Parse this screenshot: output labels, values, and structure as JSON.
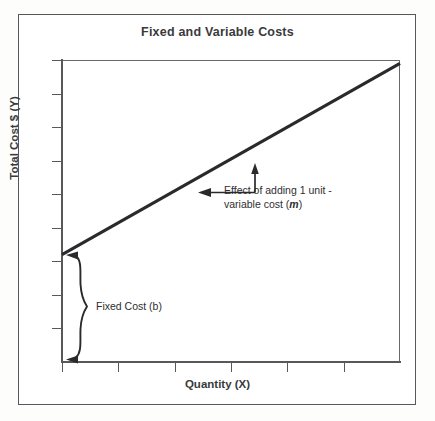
{
  "figure": {
    "title": "Fixed and Variable Costs"
  },
  "chart_data": {
    "type": "line",
    "title": "Fixed and Variable Costs",
    "xlabel": "Quantity (X)",
    "ylabel": "Total Cost $ (Y)",
    "xlim": [
      0,
      6
    ],
    "ylim": [
      0,
      9
    ],
    "grid": false,
    "legend": null,
    "tick_labels": {
      "x": [],
      "y": []
    },
    "x_tick_count": 6,
    "y_tick_count": 9,
    "series": [
      {
        "name": "Total Cost",
        "equation": "Y = mX + b",
        "intercept_b": 3.2,
        "slope_m": 0.95,
        "x": [
          0,
          6
        ],
        "values": [
          3.2,
          8.9
        ]
      }
    ],
    "annotations": [
      {
        "name": "slope-annotation",
        "text_line_1": "Effect of adding 1 unit -",
        "text_line_2": "variable cost (",
        "variable": "m",
        "text_line_2_end": ")",
        "marker": "right-triangle-with-arrows"
      },
      {
        "name": "fixed-cost-annotation",
        "text": "Fixed Cost (b)",
        "marker": "curly-brace",
        "spans_y_from": 0,
        "spans_y_to": 3.2
      }
    ]
  },
  "icons": {
    "arrow_up": "arrow-up-icon",
    "arrow_left": "arrow-left-icon",
    "brace": "curly-brace-icon"
  },
  "colors": {
    "line": "#2a2a2c",
    "axis": "#58585a",
    "border": "#58585a",
    "text": "#3a3a3c",
    "background": "#ffffff"
  }
}
